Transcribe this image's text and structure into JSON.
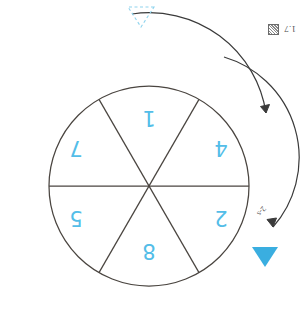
{
  "figure": {
    "label": "1.7",
    "icon": "hatched-square-icon"
  },
  "colors": {
    "accent": "#53bde8",
    "stroke": "#4a4540",
    "text": "#4a4a4a"
  },
  "wheel": {
    "name": "six-sector-circle",
    "center": {
      "x": 155,
      "y": 139
    },
    "radius": 100,
    "sector_count": 6,
    "sectors": [
      {
        "position": "top",
        "label": "8"
      },
      {
        "position": "upper-right",
        "label": "5"
      },
      {
        "position": "lower-right",
        "label": "7"
      },
      {
        "position": "bottom",
        "label": "1"
      },
      {
        "position": "lower-left",
        "label": "4"
      },
      {
        "position": "upper-left",
        "label": "2"
      }
    ]
  },
  "annotations": {
    "rotation_arrow": {
      "name": "curved-rotation-arrow",
      "direction": "counterclockwise"
    },
    "arc_label": "2-s",
    "solid_marker": {
      "name": "solid-triangle-marker",
      "color": "#3aaee0"
    },
    "dashed_marker": {
      "name": "dashed-triangle-marker",
      "color": "#8fd4ee"
    }
  }
}
